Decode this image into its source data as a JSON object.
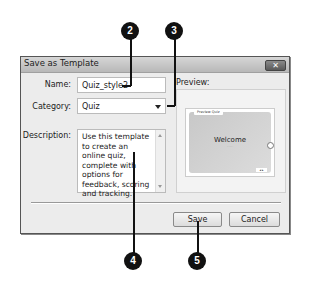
{
  "dialog": {
    "title": "Save as Template",
    "close_label": "✕",
    "fields": {
      "name": {
        "label": "Name:",
        "value": "Quiz_style2"
      },
      "category": {
        "label": "Category:",
        "value": "Quiz"
      },
      "description": {
        "label": "Description:",
        "value": "Use this template to create an online quiz, complete with options for feedback, scoring and tracking."
      }
    },
    "preview": {
      "label": "Preview:",
      "thumbnail": {
        "tab": "Preview Quiz",
        "heading": "Welcome",
        "subtitle": "········",
        "nav": "◂ ▸"
      }
    },
    "buttons": {
      "save": "Save",
      "cancel": "Cancel"
    }
  },
  "callouts": [
    "2",
    "3",
    "4",
    "5"
  ]
}
